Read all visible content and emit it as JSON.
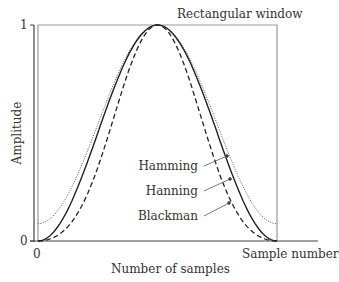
{
  "chart_data": {
    "type": "line",
    "title": "",
    "xlabel": "Number of samples",
    "ylabel": "Amplitude",
    "x_end_label": "Sample number",
    "xlim": [
      0,
      1
    ],
    "ylim": [
      0,
      1
    ],
    "x_ticks": [
      "0"
    ],
    "y_ticks": [
      "0",
      "1"
    ],
    "grid": false,
    "series": [
      {
        "name": "Rectangular window",
        "style": "gray-solid-box",
        "values_desc": "constant 1 over window",
        "x": [
          0,
          1
        ],
        "y": [
          1,
          1
        ]
      },
      {
        "name": "Hamming",
        "style": "dotted",
        "formula": "0.54-0.46cos(2πn/N)",
        "x": [
          0,
          0.125,
          0.25,
          0.375,
          0.5,
          0.625,
          0.75,
          0.875,
          1
        ],
        "y": [
          0.08,
          0.21,
          0.54,
          0.87,
          1.0,
          0.87,
          0.54,
          0.21,
          0.08
        ]
      },
      {
        "name": "Hanning",
        "style": "solid",
        "formula": "0.5-0.5cos(2πn/N)",
        "x": [
          0,
          0.125,
          0.25,
          0.375,
          0.5,
          0.625,
          0.75,
          0.875,
          1
        ],
        "y": [
          0.0,
          0.15,
          0.5,
          0.85,
          1.0,
          0.85,
          0.5,
          0.15,
          0.0
        ]
      },
      {
        "name": "Blackman",
        "style": "dashed",
        "formula": "0.42-0.5cos(2πn/N)+0.08cos(4πn/N)",
        "x": [
          0,
          0.125,
          0.25,
          0.375,
          0.5,
          0.625,
          0.75,
          0.875,
          1
        ],
        "y": [
          0.0,
          0.07,
          0.34,
          0.77,
          1.0,
          0.77,
          0.34,
          0.07,
          0.0
        ]
      }
    ],
    "annotations": [
      "Rectangular window",
      "Hamming",
      "Hanning",
      "Blackman"
    ]
  },
  "labels": {
    "rect": "Rectangular window",
    "hamming": "Hamming",
    "hanning": "Hanning",
    "blackman": "Blackman",
    "xlabel": "Number of samples",
    "xend": "Sample number",
    "ylabel": "Amplitude",
    "y1": "1",
    "y0": "0",
    "x0": "0"
  }
}
